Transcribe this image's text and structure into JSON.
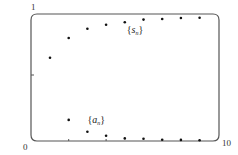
{
  "chart_data": {
    "type": "scatter",
    "title": "",
    "xlabel": "",
    "ylabel": "",
    "xlim": [
      0,
      10
    ],
    "ylim": [
      0,
      1
    ],
    "grid": false,
    "legend": "inline labels",
    "tick_labels": {
      "x_min": "0",
      "x_max": "10",
      "y_max": "1"
    },
    "series": [
      {
        "name": "{s_n}",
        "label_main": "s",
        "label_sub": "n",
        "x": [
          1,
          2,
          3,
          4,
          5,
          6,
          7,
          8,
          9
        ],
        "values": [
          0.63,
          0.78,
          0.85,
          0.88,
          0.9,
          0.92,
          0.924,
          0.932,
          0.934
        ],
        "label_pos": [
          5.1,
          0.82
        ]
      },
      {
        "name": "{a_n}",
        "label_main": "a",
        "label_sub": "n",
        "x": [
          2,
          3,
          4,
          5,
          6,
          7,
          8,
          9
        ],
        "values": [
          0.16,
          0.07,
          0.04,
          0.02,
          0.017,
          0.01,
          0.008,
          0.005
        ],
        "label_pos": [
          3.0,
          0.14
        ]
      }
    ],
    "colors": {
      "frame": "#555555",
      "points": "#111111"
    }
  }
}
